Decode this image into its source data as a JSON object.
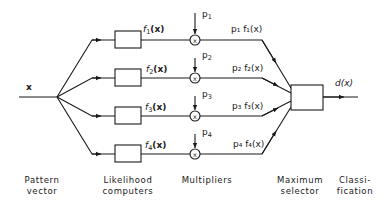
{
  "diagram": {
    "input_label": "x",
    "output_label": "d(x)",
    "branches": [
      {
        "likelihood": "f",
        "index": "1",
        "arg": "(x)",
        "prior": "p",
        "prior_index": "1",
        "product": "p₁ f₁(x)"
      },
      {
        "likelihood": "f",
        "index": "2",
        "arg": "(x)",
        "prior": "p",
        "prior_index": "2",
        "product": "p₂ f₂(x)"
      },
      {
        "likelihood": "f",
        "index": "3",
        "arg": "(x)",
        "prior": "p",
        "prior_index": "3",
        "product": "p₃ f₃(x)"
      },
      {
        "likelihood": "f",
        "index": "4",
        "arg": "(x)",
        "prior": "p",
        "prior_index": "4",
        "product": "p₄ f₄(x)"
      }
    ],
    "multiplier_symbol": "x",
    "stages": [
      {
        "line1": "Pattern",
        "line2": "vector"
      },
      {
        "line1": "Likelihood",
        "line2": "computers"
      },
      {
        "line1": "Multipliers",
        "line2": ""
      },
      {
        "line1": "Maximum",
        "line2": "selector"
      },
      {
        "line1": "Classi-",
        "line2": "fication"
      }
    ],
    "colors": {
      "ink": "#1a1a1a",
      "background": "#ffffff"
    }
  }
}
